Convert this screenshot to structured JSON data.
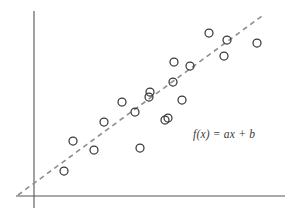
{
  "figure": {
    "title": "",
    "background_color": "#ffffff",
    "width": 293,
    "height": 220
  },
  "annotation": {
    "equation_label": "f(x) = ax + b",
    "equation_color": "#3b3b3b"
  },
  "axes": {
    "axis_color": "#555555",
    "axis_line_width": 1.1,
    "x_axis": {
      "x_start": 16,
      "x_end": 285,
      "y": 196
    },
    "y_axis": {
      "x": 34,
      "y_start": 11,
      "y_end": 208
    },
    "x_tick_labels": [],
    "y_tick_labels": [],
    "grid": false,
    "xlabel": "",
    "ylabel": ""
  },
  "trend_line": {
    "label": "f(x) = ax + b",
    "style": "dashed",
    "color": "#8d8d94",
    "width": 1.6,
    "dash_pattern": "5,4",
    "x1": 18,
    "y1": 195,
    "x2": 262,
    "y2": 16
  },
  "marker": {
    "shape": "open-circle",
    "radius": 4.0,
    "stroke_color": "#3a3a3a",
    "stroke_width": 1.25,
    "fill": "none"
  },
  "chart_data": {
    "type": "scatter",
    "title": "",
    "xlabel": "",
    "ylabel": "",
    "grid": false,
    "legend_position": "none",
    "annotations": [
      "f(x) = ax + b"
    ],
    "axis_pixel_origin": {
      "x": 34,
      "y": 196
    },
    "xlim": [
      0,
      10
    ],
    "ylim": [
      0,
      10
    ],
    "series": [
      {
        "name": "observations",
        "marker": "open-circle",
        "points_px": [
          [
            64,
            171
          ],
          [
            73,
            141
          ],
          [
            94,
            150
          ],
          [
            104,
            122
          ],
          [
            122,
            102
          ],
          [
            135,
            112
          ],
          [
            140,
            148
          ],
          [
            149,
            97
          ],
          [
            150,
            92
          ],
          [
            165,
            120
          ],
          [
            168,
            118
          ],
          [
            173,
            82
          ],
          [
            174,
            62
          ],
          [
            182,
            100
          ],
          [
            190,
            66
          ],
          [
            209,
            33
          ],
          [
            224,
            56
          ],
          [
            227,
            40
          ],
          [
            257,
            43
          ]
        ],
        "x": [
          1.19,
          1.55,
          2.38,
          2.78,
          3.49,
          4.01,
          4.21,
          4.56,
          4.6,
          5.2,
          5.2,
          5.52,
          5.56,
          5.87,
          6.19,
          6.94,
          7.54,
          7.66,
          8.85
        ],
        "y": [
          1.32,
          3.03,
          2.42,
          3.84,
          4.85,
          4.34,
          2.52,
          5.1,
          5.36,
          3.92,
          4.02,
          5.86,
          6.88,
          4.95,
          6.68,
          8.37,
          7.2,
          8.02,
          7.86
        ]
      }
    ],
    "fit": {
      "type": "linear",
      "equation": "f(x) = ax + b",
      "style": "dashed",
      "x_range_px": [
        18,
        262
      ],
      "y_range_px": [
        195,
        16
      ]
    }
  }
}
